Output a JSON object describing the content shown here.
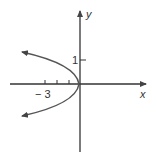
{
  "diagram": {
    "type": "graph",
    "axes": {
      "x_label": "x",
      "y_label": "y",
      "x_tick_label": "− 3",
      "y_tick_label": "1",
      "x_ticks": [
        -3,
        -2,
        -1
      ],
      "y_ticks": [
        1
      ]
    },
    "curve": {
      "kind": "parabola",
      "vertex": [
        0,
        0
      ],
      "opens": "left",
      "arrows": [
        "upper-left",
        "lower-left"
      ]
    },
    "colors": {
      "axis": "#333333",
      "curve": "#555555"
    }
  }
}
